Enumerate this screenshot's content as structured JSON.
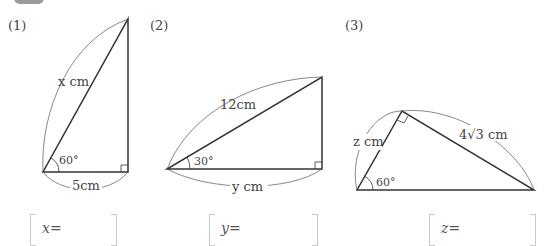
{
  "problems": [
    {
      "number": "(1)",
      "hypotenuse_label": "x cm",
      "base_label": "5cm",
      "angle_label": "60°",
      "answer_prompt": "x="
    },
    {
      "number": "(2)",
      "hypotenuse_label": "12cm",
      "base_label": "y cm",
      "angle_label": "30°",
      "answer_prompt": "y="
    },
    {
      "number": "(3)",
      "short_leg_label": "z cm",
      "long_leg_label": "4√3 cm",
      "angle_label": "60°",
      "answer_prompt": "z="
    }
  ]
}
